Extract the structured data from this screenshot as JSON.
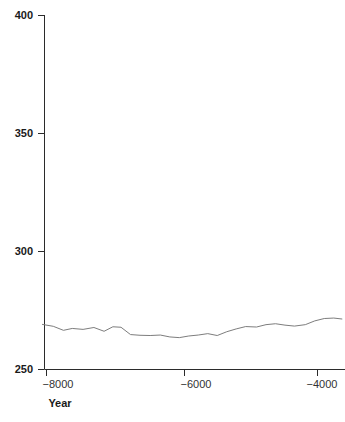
{
  "chart_data": {
    "type": "line",
    "title": "",
    "subtitle": "",
    "xlabel": "Year",
    "ylabel": "",
    "xlim": [
      -8060,
      -3620
    ],
    "ylim": [
      250,
      400
    ],
    "grid": false,
    "legend": null,
    "annotations": [],
    "y_ticks": [
      250,
      300,
      350,
      400
    ],
    "y_tick_labels": [
      "250",
      "300",
      "350",
      "400"
    ],
    "x_ticks": [
      -8000,
      -6000,
      -4000
    ],
    "x_tick_labels": [
      "−8000",
      "−6000",
      "−4000"
    ],
    "series": [
      {
        "name": "series-1",
        "color": "#7d7d7d",
        "x": [
          -8060,
          -7900,
          -7750,
          -7620,
          -7460,
          -7300,
          -7150,
          -7020,
          -6900,
          -6760,
          -6620,
          -6470,
          -6320,
          -6180,
          -6040,
          -5900,
          -5760,
          -5620,
          -5480,
          -5340,
          -5200,
          -5060,
          -4900,
          -4760,
          -4620,
          -4480,
          -4340,
          -4180,
          -4040,
          -3900,
          -3760,
          -3640
        ],
        "y": [
          269.1,
          268.3,
          266.6,
          267.4,
          267.0,
          267.8,
          266.2,
          268.1,
          267.9,
          264.8,
          264.5,
          264.4,
          264.6,
          263.8,
          263.5,
          264.2,
          264.6,
          265.2,
          264.4,
          266.0,
          267.2,
          268.2,
          268.0,
          269.0,
          269.4,
          268.8,
          268.4,
          269.0,
          270.6,
          271.6,
          271.8,
          271.4
        ]
      }
    ]
  },
  "axes": {
    "x_title": "Year"
  }
}
